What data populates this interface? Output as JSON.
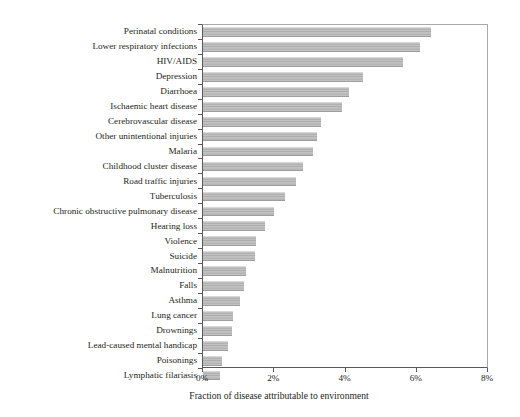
{
  "chart_data": {
    "type": "bar",
    "orientation": "horizontal",
    "title": "",
    "xlabel": "Fraction of disease attributable to environment",
    "ylabel": "",
    "xlim": [
      0,
      8
    ],
    "xtick_labels": [
      "0%",
      "2%",
      "4%",
      "6%",
      "8%"
    ],
    "xtick_values": [
      0,
      2,
      4,
      6,
      8
    ],
    "grid": false,
    "legend": null,
    "units": "percent",
    "categories": [
      "Perinatal conditions",
      "Lower respiratory infections",
      "HIV/AIDS",
      "Depression",
      "Diarrhoea",
      "Ischaemic heart disease",
      "Cerebrovascular disease",
      "Other unintentional injuries",
      "Malaria",
      "Childhood cluster disease",
      "Road traffic injuries",
      "Tuberculosis",
      "Chronic obstructive pulmonary disease",
      "Hearing loss",
      "Violence",
      "Suicide",
      "Malnutrition",
      "Falls",
      "Asthma",
      "Lung cancer",
      "Drownings",
      "Lead-caused mental handicap",
      "Poisonings",
      "Lymphatic filariasis"
    ],
    "values": [
      6.4,
      6.1,
      5.6,
      4.5,
      4.1,
      3.9,
      3.3,
      3.2,
      3.1,
      2.8,
      2.6,
      2.3,
      2.0,
      1.75,
      1.5,
      1.45,
      1.2,
      1.15,
      1.05,
      0.85,
      0.8,
      0.7,
      0.53,
      0.47
    ],
    "bar_color": "#b8b8b8",
    "axis_color": "#58595b"
  }
}
